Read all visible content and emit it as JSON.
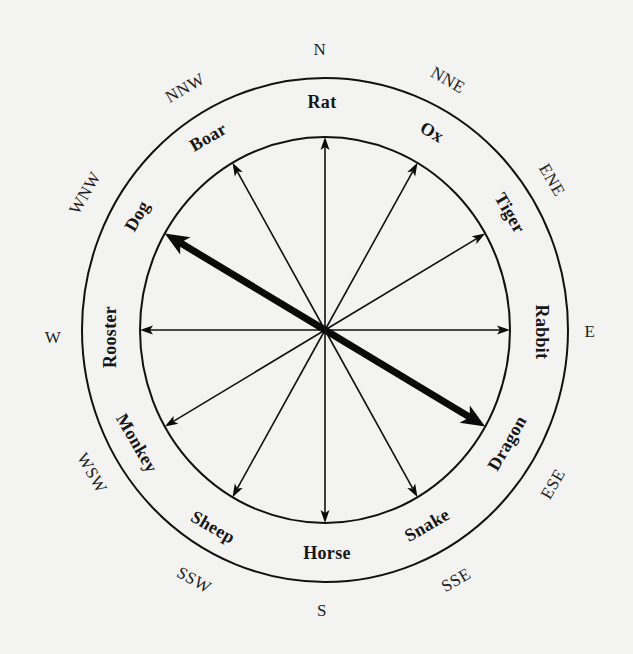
{
  "diagram": {
    "center": {
      "x": 325,
      "y": 330
    },
    "inner_ring": {
      "rx": 185,
      "ry": 193
    },
    "outer_ring": {
      "rx": 243,
      "ry": 252
    },
    "colors": {
      "background": "#f3f3f2",
      "ink": "#111111"
    },
    "compass_labels": [
      {
        "label": "N",
        "angle": 0,
        "x": 320,
        "y": 49,
        "rotate": 0
      },
      {
        "label": "NNE",
        "angle": 30,
        "x": 448,
        "y": 80,
        "rotate": 30
      },
      {
        "label": "ENE",
        "angle": 60,
        "x": 552,
        "y": 180,
        "rotate": 60
      },
      {
        "label": "E",
        "angle": 90,
        "x": 590,
        "y": 331,
        "rotate": 0
      },
      {
        "label": "ESE",
        "angle": 120,
        "x": 553,
        "y": 484,
        "rotate": -60
      },
      {
        "label": "SSE",
        "angle": 150,
        "x": 456,
        "y": 580,
        "rotate": -30
      },
      {
        "label": "S",
        "angle": 180,
        "x": 322,
        "y": 610,
        "rotate": 0
      },
      {
        "label": "SSW",
        "angle": 210,
        "x": 194,
        "y": 580,
        "rotate": 30
      },
      {
        "label": "WSW",
        "angle": 240,
        "x": 92,
        "y": 473,
        "rotate": 60
      },
      {
        "label": "W",
        "angle": 270,
        "x": 53,
        "y": 337,
        "rotate": 0
      },
      {
        "label": "WNW",
        "angle": 300,
        "x": 85,
        "y": 193,
        "rotate": -60
      },
      {
        "label": "NNW",
        "angle": 330,
        "x": 185,
        "y": 88,
        "rotate": -30
      }
    ],
    "zodiac_labels": [
      {
        "label": "Rat",
        "angle": 0,
        "x": 322,
        "y": 102,
        "rotate": 0
      },
      {
        "label": "Ox",
        "angle": 30,
        "x": 432,
        "y": 132,
        "rotate": 30
      },
      {
        "label": "Tiger",
        "angle": 60,
        "x": 510,
        "y": 213,
        "rotate": 60
      },
      {
        "label": "Rabbit",
        "angle": 90,
        "x": 542,
        "y": 332,
        "rotate": 90
      },
      {
        "label": "Dragon",
        "angle": 120,
        "x": 507,
        "y": 443,
        "rotate": -60
      },
      {
        "label": "Snake",
        "angle": 150,
        "x": 427,
        "y": 525,
        "rotate": -30
      },
      {
        "label": "Horse",
        "angle": 180,
        "x": 327,
        "y": 553,
        "rotate": 0
      },
      {
        "label": "Sheep",
        "angle": 210,
        "x": 213,
        "y": 527,
        "rotate": 30
      },
      {
        "label": "Monkey",
        "angle": 240,
        "x": 137,
        "y": 443,
        "rotate": 60
      },
      {
        "label": "Rooster",
        "angle": 270,
        "x": 110,
        "y": 337,
        "rotate": -90
      },
      {
        "label": "Dog",
        "angle": 300,
        "x": 137,
        "y": 216,
        "rotate": -60
      },
      {
        "label": "Boar",
        "angle": 330,
        "x": 208,
        "y": 137,
        "rotate": -30
      }
    ],
    "arrows": [
      {
        "target": "Rat",
        "angle": 0,
        "style": "thin"
      },
      {
        "target": "Ox",
        "angle": 30,
        "style": "thin"
      },
      {
        "target": "Tiger",
        "angle": 60,
        "style": "thin"
      },
      {
        "target": "Rabbit",
        "angle": 90,
        "style": "thin"
      },
      {
        "target": "Dragon",
        "angle": 120,
        "style": "thick"
      },
      {
        "target": "Snake",
        "angle": 150,
        "style": "thin"
      },
      {
        "target": "Horse",
        "angle": 180,
        "style": "thin"
      },
      {
        "target": "Sheep",
        "angle": 210,
        "style": "thin"
      },
      {
        "target": "Monkey",
        "angle": 240,
        "style": "thin"
      },
      {
        "target": "Rooster",
        "angle": 270,
        "style": "thin"
      },
      {
        "target": "Dog",
        "angle": 300,
        "style": "thick"
      },
      {
        "target": "Boar",
        "angle": 330,
        "style": "thin"
      }
    ],
    "highlighted_axis": [
      "Dog",
      "Dragon"
    ]
  }
}
